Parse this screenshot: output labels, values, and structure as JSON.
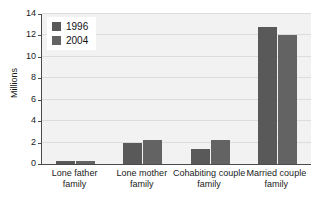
{
  "chart_data": {
    "type": "bar",
    "title": "",
    "xlabel": "",
    "ylabel": "Millions",
    "ylim": [
      0,
      14
    ],
    "ytick_step": 2,
    "yticks": [
      0,
      2,
      4,
      6,
      8,
      10,
      12,
      14
    ],
    "grid": true,
    "legend_position": "top-left",
    "categories": [
      "Lone father family",
      "Lone mother family",
      "Cohabiting couple family",
      "Married couple family"
    ],
    "category_lines": [
      [
        "Lone father",
        "family"
      ],
      [
        "Lone mother",
        "family"
      ],
      [
        "Cohabiting couple",
        "family"
      ],
      [
        "Married couple",
        "family"
      ]
    ],
    "series": [
      {
        "name": "1996",
        "color": "#595959",
        "values": [
          0.3,
          2.0,
          1.4,
          12.8
        ]
      },
      {
        "name": "2004",
        "color": "#636363",
        "values": [
          0.25,
          2.2,
          2.2,
          12.0
        ]
      }
    ]
  },
  "style": {
    "plot_background": "#f2f2f2",
    "page_background": "#ffffff",
    "gridline_color": "#dcdcdc",
    "axis_color": "#4a4a4a",
    "text_color": "#1a1a1a"
  }
}
